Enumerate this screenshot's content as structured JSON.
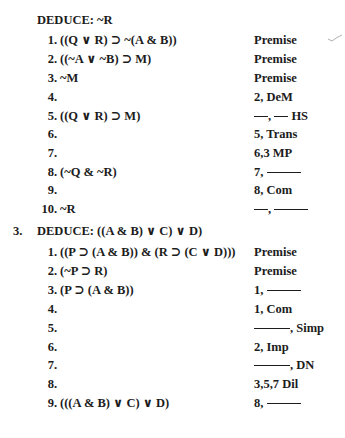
{
  "problem2": {
    "header": "DEDUCE: ~R",
    "lines": [
      {
        "num": "1.",
        "formula": "((Q ∨ R) ⊃ ~(A & B))",
        "just": "Premise"
      },
      {
        "num": "2.",
        "formula": "((~A ∨ ~B) ⊃ M)",
        "just": "Premise"
      },
      {
        "num": "3.",
        "formula": "~M",
        "just": "Premise"
      },
      {
        "num": "4.",
        "formula": "",
        "just": "2, DeM"
      },
      {
        "num": "5.",
        "formula": "((Q ∨ R) ⊃ M)",
        "just_pre": "",
        "just_mid": ",",
        "just_post": "HS"
      },
      {
        "num": "6.",
        "formula": "",
        "just": "5, Trans"
      },
      {
        "num": "7.",
        "formula": "",
        "just": "6,3 MP"
      },
      {
        "num": "8.",
        "formula": "(~Q & ~R)",
        "just_pre": "7,",
        "just_post": ""
      },
      {
        "num": "9.",
        "formula": "",
        "just": "8, Com"
      },
      {
        "num": "10.",
        "formula": "~R",
        "just_mid": ","
      }
    ]
  },
  "problem3": {
    "number": "3.",
    "header": "DEDUCE: ((A & B) ∨ C) ∨ D)",
    "lines": [
      {
        "num": "1.",
        "formula": "((P ⊃ (A & B)) & (R ⊃ (C ∨ D)))",
        "just": "Premise"
      },
      {
        "num": "2.",
        "formula": "(~P ⊃ R)",
        "just": "Premise"
      },
      {
        "num": "3.",
        "formula": "(P ⊃ (A & B))",
        "just_pre": "1,"
      },
      {
        "num": "4.",
        "formula": "",
        "just": "1, Com"
      },
      {
        "num": "5.",
        "formula": "",
        "just_post": ", Simp"
      },
      {
        "num": "6.",
        "formula": "",
        "just": "2, Imp"
      },
      {
        "num": "7.",
        "formula": "",
        "just_post": ", DN"
      },
      {
        "num": "8.",
        "formula": "",
        "just": "3,5,7 Dil"
      },
      {
        "num": "9.",
        "formula": "(((A & B) ∨ C) ∨ D)",
        "just_pre": "8,"
      }
    ]
  },
  "annotations": {
    "checkmark": "check-mark"
  }
}
